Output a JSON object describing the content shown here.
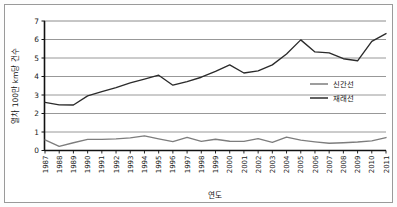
{
  "chart_data": {
    "type": "line",
    "title": "",
    "xlabel": "연도",
    "ylabel": "열차 100만 km당 건수",
    "xlim": [
      1987,
      2011
    ],
    "ylim": [
      0,
      7
    ],
    "ytick_step": 1,
    "grid": true,
    "legend_position": "right-inside",
    "yticks": [
      "0",
      "1",
      "2",
      "3",
      "4",
      "5",
      "6",
      "7"
    ],
    "categories": [
      "1987",
      "1988",
      "1989",
      "1990",
      "1991",
      "1992",
      "1993",
      "1994",
      "1995",
      "1996",
      "1997",
      "1998",
      "1999",
      "2000",
      "2001",
      "2002",
      "2003",
      "2004",
      "2005",
      "2006",
      "2007",
      "2008",
      "2009",
      "2010",
      "2011"
    ],
    "series": [
      {
        "name": "신간선",
        "color": "#7d7d7d",
        "values": [
          0.57,
          0.22,
          0.42,
          0.6,
          0.6,
          0.63,
          0.68,
          0.79,
          0.63,
          0.48,
          0.71,
          0.49,
          0.61,
          0.5,
          0.49,
          0.64,
          0.44,
          0.72,
          0.56,
          0.47,
          0.39,
          0.42,
          0.46,
          0.52,
          0.7
        ]
      },
      {
        "name": "재래선",
        "color": "#2b2b2b",
        "values": [
          2.6,
          2.47,
          2.46,
          2.95,
          3.18,
          3.4,
          3.66,
          3.86,
          4.07,
          3.53,
          3.72,
          3.96,
          4.28,
          4.63,
          4.19,
          4.3,
          4.63,
          5.22,
          5.98,
          5.33,
          5.28,
          4.96,
          4.85,
          5.9,
          6.32
        ]
      }
    ]
  },
  "legend": {
    "items": [
      {
        "label": "신간선"
      },
      {
        "label": "재래선"
      }
    ]
  },
  "axes": {
    "x_title": "연도",
    "y_title": "열차 100만 km당 건수"
  }
}
